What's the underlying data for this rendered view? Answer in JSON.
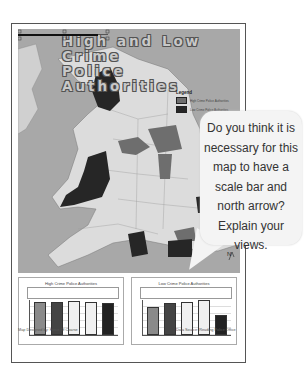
{
  "map": {
    "title_line1": "High and Low Crime",
    "title_line2": "Police Authorities",
    "legend": {
      "heading": "Legend",
      "items": [
        {
          "label": "High Crime Police Authorities",
          "color": "#6e6e6e"
        },
        {
          "label": "Low Crime Police Authorities",
          "color": "#262626"
        }
      ]
    },
    "north_label": "N",
    "colors": {
      "sea": "#a8a8a8",
      "land": "#dcdcdc",
      "high": "#6e6e6e",
      "low": "#262626"
    }
  },
  "bubble": {
    "text": "Do you think it is necessary for this map to have a scale bar and north arrow? Explain your views."
  },
  "charts": [
    {
      "title": "High Crime Police Authorities",
      "bars": [
        {
          "color": "#8a8a8a",
          "value": 95
        },
        {
          "color": "#444444",
          "value": 95
        },
        {
          "color": "#f0f0f0",
          "value": 97
        },
        {
          "color": "#f0f0f0",
          "value": 95
        },
        {
          "color": "#222222",
          "value": 92
        }
      ]
    },
    {
      "title": "Low Crime Police Authorities",
      "bars": [
        {
          "color": "#8a8a8a",
          "value": 80
        },
        {
          "color": "#444444",
          "value": 92
        },
        {
          "color": "#f0f0f0",
          "value": 94
        },
        {
          "color": "#f0f0f0",
          "value": 100
        },
        {
          "color": "#222222",
          "value": 56
        }
      ]
    }
  ],
  "footer": {
    "designer": "Map Designed by: Force Of Coarse",
    "source": "Data Source: Reading Police Office"
  }
}
